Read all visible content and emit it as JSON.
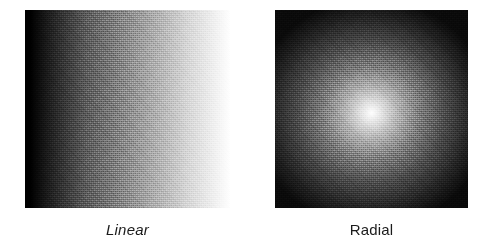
{
  "figure": {
    "background_color": "#ffffff",
    "width": 494,
    "height": 248
  },
  "panels": [
    {
      "id": "linear",
      "caption": "Linear",
      "caption_style": "italic",
      "gradient_type": "linear",
      "direction": "left-to-right",
      "start_color": "#000000",
      "end_color": "#ffffff",
      "texture": "halftone-dither",
      "x": 25,
      "y": 10,
      "width": 205,
      "height": 198
    },
    {
      "id": "radial",
      "caption": "Radial",
      "caption_style": "normal",
      "gradient_type": "radial",
      "direction": "center-to-edge",
      "start_color": "#ffffff",
      "end_color": "#0a0a0a",
      "center_x_pct": 50,
      "center_y_pct": 52,
      "texture": "halftone-dither",
      "x": 275,
      "y": 10,
      "width": 193,
      "height": 198
    }
  ],
  "colors": {
    "text": "#1b1b1b",
    "page_background": "#ffffff"
  }
}
